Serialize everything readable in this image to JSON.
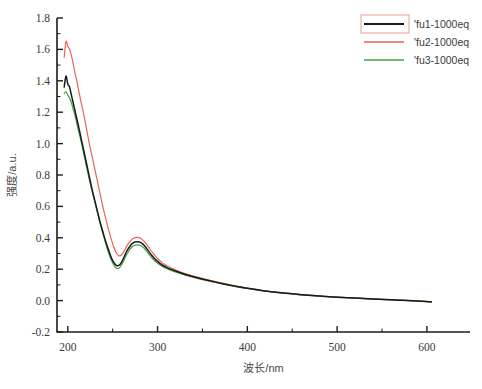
{
  "chart_data": {
    "type": "line",
    "title": "",
    "xlabel": "波长/nm",
    "ylabel": "强度/a.u.",
    "xlim": [
      188,
      648
    ],
    "ylim": [
      -0.2,
      1.8
    ],
    "xticks": [
      200,
      300,
      400,
      500,
      600
    ],
    "xticklabels": [
      "200",
      "300",
      "400",
      "500",
      "600"
    ],
    "yticks": [
      -0.2,
      0.0,
      0.2,
      0.4,
      0.6,
      0.8,
      1.0,
      1.2,
      1.4,
      1.6,
      1.8
    ],
    "yticklabels": [
      "-0.2",
      "0.0",
      "0.2",
      "0.4",
      "0.6",
      "0.8",
      "1.0",
      "1.2",
      "1.4",
      "1.6",
      "1.8"
    ],
    "grid": false,
    "minor_ticks": true,
    "legend_position": "top-right",
    "series": [
      {
        "name": "'fu1-1000eq",
        "color": "#1a1a1a",
        "x": [
          196,
          198,
          200,
          202,
          204,
          206,
          208,
          210,
          212,
          215,
          218,
          221,
          224,
          227,
          230,
          233,
          236,
          239,
          242,
          245,
          248,
          251,
          254,
          257,
          260,
          263,
          266,
          269,
          272,
          275,
          278,
          281,
          284,
          287,
          290,
          293,
          296,
          300,
          305,
          310,
          315,
          320,
          330,
          340,
          350,
          360,
          370,
          380,
          390,
          400,
          420,
          440,
          460,
          480,
          500,
          520,
          540,
          560,
          580,
          600,
          605
        ],
        "y": [
          1.36,
          1.43,
          1.38,
          1.36,
          1.31,
          1.26,
          1.21,
          1.16,
          1.11,
          1.03,
          0.95,
          0.87,
          0.79,
          0.71,
          0.64,
          0.57,
          0.5,
          0.44,
          0.38,
          0.33,
          0.28,
          0.245,
          0.225,
          0.224,
          0.245,
          0.282,
          0.318,
          0.345,
          0.364,
          0.373,
          0.375,
          0.371,
          0.358,
          0.338,
          0.315,
          0.292,
          0.272,
          0.25,
          0.228,
          0.212,
          0.199,
          0.188,
          0.168,
          0.152,
          0.138,
          0.124,
          0.111,
          0.099,
          0.088,
          0.078,
          0.061,
          0.048,
          0.038,
          0.029,
          0.022,
          0.016,
          0.01,
          0.005,
          0.0,
          -0.006,
          -0.008
        ]
      },
      {
        "name": "'fu2-1000eq",
        "color": "#e8635a",
        "x": [
          196,
          198,
          200,
          202,
          204,
          206,
          208,
          210,
          212,
          215,
          218,
          221,
          224,
          227,
          230,
          233,
          236,
          239,
          242,
          245,
          248,
          251,
          254,
          257,
          260,
          263,
          266,
          269,
          272,
          275,
          278,
          281,
          284,
          287,
          290,
          293,
          296,
          300,
          305,
          310,
          315,
          320,
          330,
          340,
          350,
          360,
          370,
          380,
          390,
          400,
          420,
          440,
          460,
          480,
          500,
          520,
          540,
          560,
          580,
          600,
          605
        ],
        "y": [
          1.55,
          1.65,
          1.62,
          1.6,
          1.56,
          1.51,
          1.45,
          1.4,
          1.34,
          1.26,
          1.18,
          1.09,
          1.0,
          0.92,
          0.84,
          0.76,
          0.68,
          0.6,
          0.53,
          0.46,
          0.4,
          0.345,
          0.305,
          0.285,
          0.292,
          0.318,
          0.35,
          0.374,
          0.392,
          0.401,
          0.403,
          0.397,
          0.384,
          0.364,
          0.34,
          0.316,
          0.294,
          0.268,
          0.242,
          0.223,
          0.208,
          0.195,
          0.173,
          0.156,
          0.141,
          0.127,
          0.114,
          0.101,
          0.09,
          0.08,
          0.062,
          0.049,
          0.039,
          0.03,
          0.023,
          0.017,
          0.011,
          0.005,
          0.0,
          -0.006,
          -0.008
        ]
      },
      {
        "name": "'fu3-1000eq",
        "color": "#3fa03f",
        "x": [
          196,
          198,
          200,
          202,
          204,
          206,
          208,
          210,
          212,
          215,
          218,
          221,
          224,
          227,
          230,
          233,
          236,
          239,
          242,
          245,
          248,
          251,
          254,
          257,
          260,
          263,
          266,
          269,
          272,
          275,
          278,
          281,
          284,
          287,
          290,
          293,
          296,
          300,
          305,
          310,
          315,
          320,
          330,
          340,
          350,
          360,
          370,
          380,
          390,
          400,
          420,
          440,
          460,
          480,
          500,
          520,
          540,
          560,
          580,
          600,
          605
        ],
        "y": [
          1.32,
          1.33,
          1.31,
          1.29,
          1.26,
          1.22,
          1.18,
          1.13,
          1.08,
          1.01,
          0.93,
          0.85,
          0.77,
          0.7,
          0.63,
          0.56,
          0.49,
          0.43,
          0.37,
          0.31,
          0.265,
          0.228,
          0.207,
          0.206,
          0.228,
          0.263,
          0.298,
          0.325,
          0.344,
          0.353,
          0.355,
          0.351,
          0.339,
          0.32,
          0.298,
          0.277,
          0.258,
          0.238,
          0.219,
          0.204,
          0.192,
          0.182,
          0.163,
          0.148,
          0.134,
          0.121,
          0.109,
          0.097,
          0.086,
          0.077,
          0.06,
          0.047,
          0.037,
          0.029,
          0.022,
          0.016,
          0.01,
          0.005,
          0.0,
          -0.006,
          -0.008
        ]
      }
    ]
  },
  "legend": {
    "items": [
      {
        "label": "'fu1-1000eq",
        "color": "#1a1a1a",
        "selected": true
      },
      {
        "label": "'fu2-1000eq",
        "color": "#e8635a",
        "selected": false
      },
      {
        "label": "'fu3-1000eq",
        "color": "#3fa03f",
        "selected": false
      }
    ],
    "selection_border_color": "#eda89f"
  },
  "colors": {
    "axis": "#1c1c1c",
    "background": "#ffffff",
    "series_1": "#1a1a1a",
    "series_2": "#e8635a",
    "series_3": "#3fa03f"
  }
}
